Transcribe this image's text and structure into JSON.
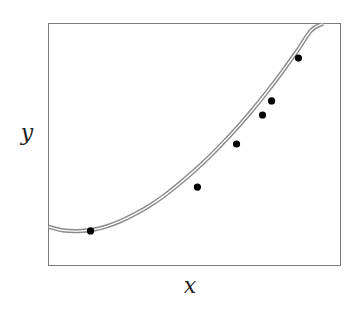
{
  "chart_data": {
    "type": "scatter",
    "title": "",
    "xlabel": "x",
    "ylabel": "y",
    "grid": false,
    "legend": null,
    "ticks": {
      "x": [],
      "y": []
    },
    "xlim": [
      0,
      1
    ],
    "ylim": [
      0,
      1
    ],
    "series": [
      {
        "name": "fitted curve",
        "kind": "line",
        "style": "double-line",
        "color": "#888888",
        "x": [
          0.0,
          0.05,
          0.1,
          0.15,
          0.2,
          0.25,
          0.3,
          0.35,
          0.4,
          0.45,
          0.5,
          0.55,
          0.6,
          0.65,
          0.7,
          0.75,
          0.8,
          0.85,
          0.9,
          0.94
        ],
        "y": [
          0.16,
          0.145,
          0.142,
          0.147,
          0.162,
          0.185,
          0.215,
          0.25,
          0.292,
          0.34,
          0.392,
          0.448,
          0.51,
          0.575,
          0.645,
          0.72,
          0.8,
          0.884,
          0.972,
          1.0
        ]
      },
      {
        "name": "data points",
        "kind": "scatter",
        "color": "#000000",
        "x": [
          0.144,
          0.51,
          0.644,
          0.733,
          0.764,
          0.856
        ],
        "y": [
          0.143,
          0.324,
          0.502,
          0.622,
          0.68,
          0.857
        ]
      }
    ]
  }
}
